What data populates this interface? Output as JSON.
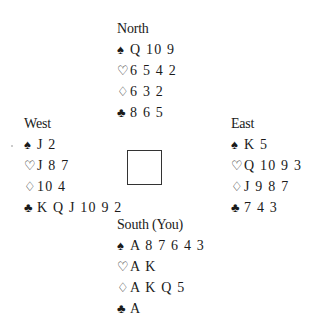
{
  "hands": {
    "north": {
      "label": "North",
      "spades": "Q 10 9",
      "hearts": "6 5 4 2",
      "diamonds": "6 3 2",
      "clubs": "8 6 5"
    },
    "west": {
      "label": "West",
      "spades": "J 2",
      "hearts": "J 8 7",
      "diamonds": "10 4",
      "clubs": "K Q J 10 9 2"
    },
    "east": {
      "label": "East",
      "spades": "K 5",
      "hearts": "Q 10 9 3",
      "diamonds": "J 9 8 7",
      "clubs": "7 4 3"
    },
    "south": {
      "label": "South (You)",
      "spades": "A 8 7 6 4 3",
      "hearts": "A K",
      "diamonds": "A K Q 5",
      "clubs": "A"
    }
  },
  "suit_symbols": {
    "spades": "♠",
    "hearts": "♡",
    "diamonds": "♢",
    "clubs": "♣"
  }
}
